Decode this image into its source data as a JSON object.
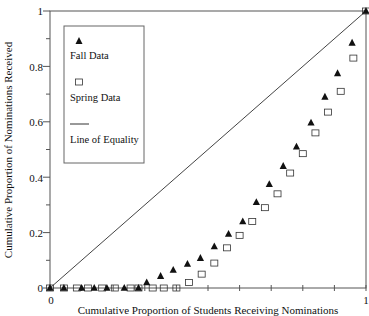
{
  "chart_data": {
    "type": "scatter",
    "title": "",
    "xlabel": "Cumulative Proportion of Students Receiving Nominations",
    "ylabel": "Cumulative Proportion of Nominations Received",
    "xlim": [
      0,
      1
    ],
    "ylim": [
      0,
      1
    ],
    "x_ticks": [
      {
        "value": 0,
        "label": "0"
      },
      {
        "value": 1,
        "label": "1"
      }
    ],
    "y_ticks": [
      {
        "value": 0,
        "label": "0"
      },
      {
        "value": 0.2,
        "label": "0.2"
      },
      {
        "value": 0.4,
        "label": "0.4"
      },
      {
        "value": 0.6,
        "label": "0.6"
      },
      {
        "value": 0.8,
        "label": "0.8"
      },
      {
        "value": 1,
        "label": "1"
      }
    ],
    "grid": false,
    "legend_position": "upper-left-inside",
    "series": [
      {
        "name": "Fall Data",
        "marker": "filled-triangle",
        "color": "#111111",
        "points": [
          [
            0.0,
            0.0
          ],
          [
            0.044,
            0.0
          ],
          [
            0.1,
            0.0
          ],
          [
            0.14,
            0.0
          ],
          [
            0.18,
            0.0
          ],
          [
            0.235,
            0.0
          ],
          [
            0.28,
            0.0
          ],
          [
            0.306,
            0.02
          ],
          [
            0.35,
            0.043
          ],
          [
            0.39,
            0.065
          ],
          [
            0.435,
            0.087
          ],
          [
            0.476,
            0.108
          ],
          [
            0.52,
            0.15
          ],
          [
            0.565,
            0.195
          ],
          [
            0.61,
            0.24
          ],
          [
            0.653,
            0.31
          ],
          [
            0.694,
            0.375
          ],
          [
            0.738,
            0.44
          ],
          [
            0.78,
            0.51
          ],
          [
            0.826,
            0.597
          ],
          [
            0.87,
            0.69
          ],
          [
            0.91,
            0.775
          ],
          [
            0.956,
            0.885
          ],
          [
            1.0,
            1.0
          ]
        ]
      },
      {
        "name": "Spring Data",
        "marker": "open-square",
        "color": "#111111",
        "points": [
          [
            0.0,
            0.0
          ],
          [
            0.044,
            0.0
          ],
          [
            0.085,
            0.0
          ],
          [
            0.12,
            0.0
          ],
          [
            0.165,
            0.0
          ],
          [
            0.205,
            0.0
          ],
          [
            0.255,
            0.0
          ],
          [
            0.28,
            0.0
          ],
          [
            0.325,
            0.0
          ],
          [
            0.36,
            0.0
          ],
          [
            0.4,
            0.0
          ],
          [
            0.44,
            0.02
          ],
          [
            0.48,
            0.05
          ],
          [
            0.52,
            0.09
          ],
          [
            0.56,
            0.145
          ],
          [
            0.6,
            0.19
          ],
          [
            0.64,
            0.24
          ],
          [
            0.68,
            0.29
          ],
          [
            0.72,
            0.34
          ],
          [
            0.76,
            0.415
          ],
          [
            0.8,
            0.485
          ],
          [
            0.84,
            0.56
          ],
          [
            0.88,
            0.635
          ],
          [
            0.92,
            0.71
          ],
          [
            0.96,
            0.83
          ],
          [
            1.0,
            1.0
          ]
        ]
      },
      {
        "name": "Line of Equality",
        "marker": "line",
        "color": "#111111",
        "points": [
          [
            0,
            0
          ],
          [
            1,
            1
          ]
        ]
      }
    ]
  },
  "legend": {
    "items": [
      {
        "label": "Fall Data",
        "symbol": "filled-triangle"
      },
      {
        "label": "Spring Data",
        "symbol": "open-square"
      },
      {
        "label": "Line of Equality",
        "symbol": "line"
      }
    ]
  },
  "axes": {
    "x_title": "Cumulative Proportion of Students Receiving Nominations",
    "y_title": "Cumulative Proportion of Nominations Received",
    "x_tick_labels": [
      "0",
      "1"
    ],
    "y_tick_labels": [
      "0",
      "0.2",
      "0.4",
      "0.6",
      "0.8",
      "1"
    ]
  }
}
